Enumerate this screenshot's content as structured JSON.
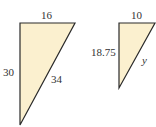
{
  "colors": {
    "fill": "#fbf0cf",
    "stroke": "#2a2a2a",
    "text": "#333333"
  },
  "triangles": [
    {
      "name": "large-triangle",
      "points": "20,23 75,23 20,125",
      "labels": {
        "top": "16",
        "left": "30",
        "hypotenuse": "34"
      }
    },
    {
      "name": "small-triangle",
      "points": "119,23 155,23 119,88",
      "labels": {
        "top": "10",
        "left": "18.75",
        "hypotenuse": "y"
      }
    }
  ]
}
